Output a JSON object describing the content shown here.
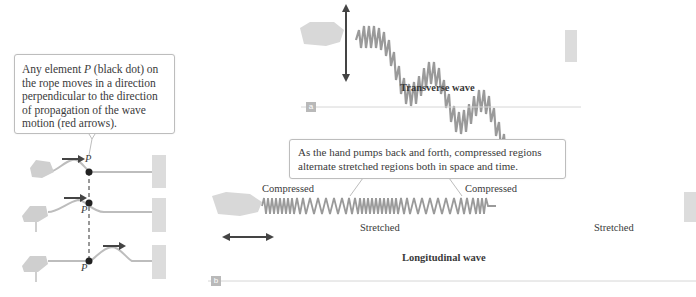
{
  "panel_left": {
    "callout_text_1": "Any element ",
    "callout_italic": "P",
    "callout_text_2": " (black dot) on the rope moves in a direction perpendicular to the direction of propagation of the wave motion (red arrows).",
    "point_label": "P",
    "frames": 3
  },
  "panel_a": {
    "tag": "a",
    "caption": "Transverse wave"
  },
  "panel_b": {
    "tag": "b",
    "caption": "Longitudinal wave",
    "callout": "As the hand pumps back and forth, compressed regions alternate stretched regions both in space and time.",
    "labels": {
      "compressed_1": "Compressed",
      "compressed_2": "Compressed",
      "stretched_1": "Stretched",
      "stretched_2": "Stretched"
    }
  },
  "colors": {
    "spring": "#9a9a9a",
    "arrow": "#444444",
    "hand": "#cfcfcf",
    "wall": "#d9d9d9",
    "dot": "#222222"
  }
}
